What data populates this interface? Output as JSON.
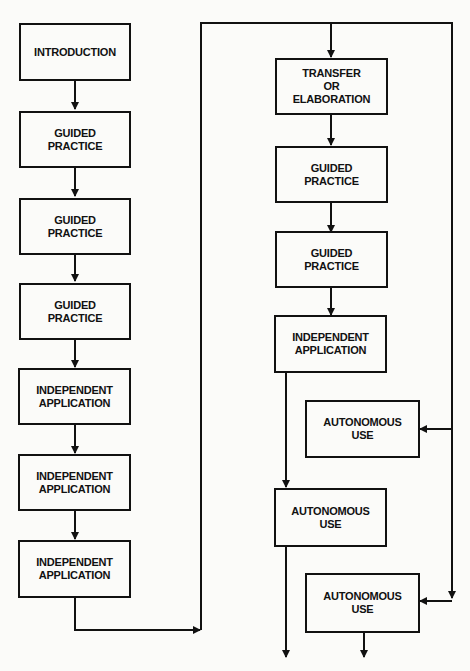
{
  "diagram": {
    "left_column": [
      {
        "id": "intro",
        "label": "INTRODUCTION"
      },
      {
        "id": "gp1",
        "label": "GUIDED\nPRACTICE"
      },
      {
        "id": "gp2",
        "label": "GUIDED\nPRACTICE"
      },
      {
        "id": "gp3",
        "label": "GUIDED\nPRACTICE"
      },
      {
        "id": "ia1",
        "label": "INDEPENDENT\nAPPLICATION"
      },
      {
        "id": "ia2",
        "label": "INDEPENDENT\nAPPLICATION"
      },
      {
        "id": "ia3",
        "label": "INDEPENDENT\nAPPLICATION"
      }
    ],
    "right_column": [
      {
        "id": "transfer",
        "label": "TRANSFER\nOR\nELABORATION"
      },
      {
        "id": "gp4",
        "label": "GUIDED\nPRACTICE"
      },
      {
        "id": "gp5",
        "label": "GUIDED\nPRACTICE"
      },
      {
        "id": "ia4",
        "label": "INDEPENDENT\nAPPLICATION"
      },
      {
        "id": "au1",
        "label": "AUTONOMOUS\nUSE"
      },
      {
        "id": "au2",
        "label": "AUTONOMOUS\nUSE"
      },
      {
        "id": "au3",
        "label": "AUTONOMOUS\nUSE"
      }
    ],
    "edges": [
      [
        "intro",
        "gp1"
      ],
      [
        "gp1",
        "gp2"
      ],
      [
        "gp2",
        "gp3"
      ],
      [
        "gp3",
        "ia1"
      ],
      [
        "ia1",
        "ia2"
      ],
      [
        "ia2",
        "ia3"
      ],
      [
        "ia3",
        "transfer"
      ],
      [
        "transfer",
        "gp4"
      ],
      [
        "gp4",
        "gp5"
      ],
      [
        "gp5",
        "ia4"
      ],
      [
        "ia4",
        "au2"
      ],
      [
        "ia3",
        "au1"
      ],
      [
        "ia3",
        "au3"
      ]
    ],
    "colors": {
      "line": "#111111",
      "background": "#fbfbf9"
    }
  }
}
